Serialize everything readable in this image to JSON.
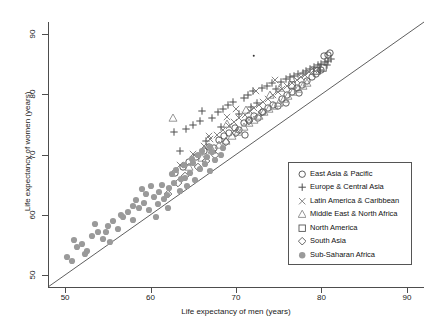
{
  "chart_data": {
    "type": "scatter",
    "title": "",
    "xlabel": "Life expectancy of men (years)",
    "ylabel": "Life expectancy of women (years)",
    "xlim": [
      48,
      92
    ],
    "ylim": [
      48,
      92
    ],
    "xticks": [
      50,
      60,
      70,
      80,
      90
    ],
    "yticks": [
      50,
      60,
      70,
      80,
      90
    ],
    "grid": false,
    "legend_position": "bottom-right",
    "annotations": [
      {
        "type": "reference-line",
        "label": "y = x identity line",
        "from": [
          48,
          48
        ],
        "to": [
          92,
          92
        ]
      }
    ],
    "series": [
      {
        "name": "East Asia & Pacific",
        "marker": "circle-open",
        "color": "#4d4d4d",
        "points": [
          [
            64.5,
            68.8
          ],
          [
            65.3,
            69.6
          ],
          [
            66.2,
            70.5
          ],
          [
            66.8,
            71.2
          ],
          [
            67.4,
            71.0
          ],
          [
            68.0,
            72.4
          ],
          [
            68.6,
            73.1
          ],
          [
            69.2,
            73.6
          ],
          [
            69.9,
            74.4
          ],
          [
            70.4,
            74.0
          ],
          [
            70.9,
            75.2
          ],
          [
            71.5,
            75.8
          ],
          [
            72.1,
            76.4
          ],
          [
            72.6,
            76.0
          ],
          [
            73.2,
            77.1
          ],
          [
            73.8,
            77.8
          ],
          [
            74.3,
            78.3
          ],
          [
            74.9,
            78.0
          ],
          [
            75.4,
            79.2
          ],
          [
            76.0,
            79.8
          ],
          [
            76.6,
            80.4
          ],
          [
            77.1,
            81.0
          ],
          [
            77.7,
            81.6
          ],
          [
            78.3,
            82.2
          ],
          [
            78.9,
            82.8
          ],
          [
            79.4,
            83.4
          ],
          [
            79.9,
            84.0
          ],
          [
            80.3,
            86.3
          ],
          [
            80.8,
            86.6
          ],
          [
            81.0,
            86.9
          ],
          [
            63.8,
            67.9
          ],
          [
            62.9,
            67.0
          ],
          [
            71.0,
            73.2
          ],
          [
            75.8,
            78.6
          ],
          [
            77.4,
            80.2
          ]
        ]
      },
      {
        "name": "Europe & Central Asia",
        "marker": "plus",
        "color": "#4d4d4d",
        "points": [
          [
            64.2,
            74.3
          ],
          [
            65.0,
            74.9
          ],
          [
            65.8,
            75.5
          ],
          [
            66.5,
            72.3
          ],
          [
            67.2,
            76.1
          ],
          [
            67.9,
            77.0
          ],
          [
            68.5,
            77.6
          ],
          [
            69.1,
            78.2
          ],
          [
            69.7,
            78.8
          ],
          [
            70.3,
            76.8
          ],
          [
            70.9,
            79.4
          ],
          [
            71.4,
            79.9
          ],
          [
            72.0,
            80.5
          ],
          [
            72.5,
            78.6
          ],
          [
            73.1,
            81.0
          ],
          [
            73.6,
            81.4
          ],
          [
            74.2,
            81.8
          ],
          [
            74.7,
            80.9
          ],
          [
            75.3,
            82.1
          ],
          [
            75.8,
            82.5
          ],
          [
            76.3,
            82.8
          ],
          [
            76.8,
            83.0
          ],
          [
            77.3,
            83.3
          ],
          [
            77.8,
            83.6
          ],
          [
            78.2,
            83.9
          ],
          [
            78.7,
            84.2
          ],
          [
            79.1,
            84.5
          ],
          [
            79.6,
            84.8
          ],
          [
            80.0,
            85.1
          ],
          [
            80.4,
            85.4
          ],
          [
            80.8,
            85.6
          ],
          [
            81.1,
            85.9
          ],
          [
            66.0,
            77.3
          ],
          [
            68.2,
            74.6
          ],
          [
            62.8,
            73.8
          ],
          [
            63.5,
            70.5
          ],
          [
            71.8,
            77.9
          ],
          [
            79.8,
            84.0
          ],
          [
            80.6,
            84.9
          ]
        ]
      },
      {
        "name": "Latin America & Caribbean",
        "marker": "x",
        "color": "#777777",
        "points": [
          [
            63.5,
            68.2
          ],
          [
            65.0,
            70.1
          ],
          [
            66.2,
            71.4
          ],
          [
            67.0,
            72.5
          ],
          [
            67.8,
            73.2
          ],
          [
            68.5,
            74.0
          ],
          [
            69.2,
            74.8
          ],
          [
            69.8,
            75.4
          ],
          [
            70.4,
            76.0
          ],
          [
            71.0,
            76.6
          ],
          [
            71.6,
            77.2
          ],
          [
            72.1,
            77.7
          ],
          [
            72.7,
            78.2
          ],
          [
            73.2,
            78.7
          ],
          [
            73.8,
            79.2
          ],
          [
            74.3,
            79.8
          ],
          [
            74.9,
            80.3
          ],
          [
            75.4,
            80.8
          ],
          [
            76.0,
            81.3
          ],
          [
            76.5,
            81.8
          ],
          [
            77.1,
            82.3
          ],
          [
            77.6,
            82.8
          ],
          [
            78.1,
            83.2
          ],
          [
            78.6,
            83.7
          ],
          [
            79.1,
            84.1
          ],
          [
            72.3,
            80.6
          ],
          [
            74.6,
            82.4
          ],
          [
            70.0,
            77.5
          ],
          [
            68.9,
            76.2
          ],
          [
            66.8,
            73.0
          ]
        ]
      },
      {
        "name": "Middle East & North Africa",
        "marker": "triangle-open",
        "color": "#8a8a8a",
        "points": [
          [
            62.6,
            76.0
          ],
          [
            64.5,
            68.0
          ],
          [
            66.0,
            69.5
          ],
          [
            67.2,
            70.8
          ],
          [
            68.0,
            71.5
          ],
          [
            68.8,
            72.3
          ],
          [
            69.5,
            73.0
          ],
          [
            70.2,
            73.8
          ],
          [
            70.9,
            74.5
          ],
          [
            71.5,
            75.2
          ],
          [
            72.1,
            75.8
          ],
          [
            72.7,
            76.4
          ],
          [
            73.3,
            77.0
          ],
          [
            73.9,
            77.5
          ],
          [
            74.5,
            78.1
          ],
          [
            75.0,
            78.6
          ],
          [
            75.6,
            79.2
          ],
          [
            76.1,
            79.7
          ],
          [
            76.7,
            80.3
          ],
          [
            77.2,
            80.8
          ],
          [
            77.8,
            81.4
          ],
          [
            78.3,
            81.9
          ],
          [
            74.0,
            79.9
          ],
          [
            75.2,
            81.1
          ],
          [
            71.2,
            77.4
          ],
          [
            69.0,
            75.0
          ]
        ]
      },
      {
        "name": "North America",
        "marker": "square-open",
        "color": "#555555",
        "points": [
          [
            76.5,
            81.5
          ],
          [
            79.5,
            83.8
          ],
          [
            80.2,
            84.4
          ]
        ]
      },
      {
        "name": "South Asia",
        "marker": "diamond-open",
        "color": "#555555",
        "points": [
          [
            62.0,
            63.5
          ],
          [
            64.0,
            66.5
          ],
          [
            65.5,
            68.0
          ],
          [
            66.5,
            69.0
          ],
          [
            67.5,
            70.0
          ],
          [
            68.8,
            72.0
          ],
          [
            70.0,
            73.5
          ],
          [
            71.5,
            75.5
          ],
          [
            73.0,
            77.0
          ],
          [
            63.2,
            65.2
          ]
        ]
      },
      {
        "name": "Sub-Saharan Africa",
        "marker": "circle-filled",
        "color": "#9a9a9a",
        "points": [
          [
            50.2,
            53.0
          ],
          [
            50.8,
            52.4
          ],
          [
            51.4,
            54.6
          ],
          [
            52.0,
            55.2
          ],
          [
            52.6,
            54.0
          ],
          [
            53.2,
            56.4
          ],
          [
            53.8,
            57.2
          ],
          [
            54.4,
            56.0
          ],
          [
            55.0,
            58.1
          ],
          [
            55.6,
            58.9
          ],
          [
            56.2,
            57.6
          ],
          [
            56.8,
            59.7
          ],
          [
            57.4,
            60.4
          ],
          [
            58.0,
            59.1
          ],
          [
            58.6,
            61.2
          ],
          [
            59.2,
            62.0
          ],
          [
            59.8,
            60.8
          ],
          [
            60.4,
            63.0
          ],
          [
            61.0,
            63.8
          ],
          [
            61.6,
            62.6
          ],
          [
            62.2,
            64.5
          ],
          [
            62.8,
            65.3
          ],
          [
            63.4,
            64.0
          ],
          [
            64.0,
            66.1
          ],
          [
            64.6,
            66.9
          ],
          [
            65.2,
            65.7
          ],
          [
            65.8,
            67.6
          ],
          [
            66.4,
            68.4
          ],
          [
            67.0,
            67.2
          ],
          [
            67.6,
            69.1
          ],
          [
            68.2,
            69.9
          ],
          [
            58.3,
            62.4
          ],
          [
            59.5,
            63.5
          ],
          [
            60.9,
            61.7
          ],
          [
            61.3,
            65.0
          ],
          [
            62.5,
            66.8
          ],
          [
            63.0,
            67.4
          ],
          [
            63.9,
            68.2
          ],
          [
            64.9,
            69.3
          ],
          [
            65.5,
            70.0
          ],
          [
            66.0,
            70.6
          ],
          [
            66.9,
            71.2
          ],
          [
            53.5,
            58.4
          ],
          [
            54.8,
            57.1
          ],
          [
            56.5,
            60.0
          ],
          [
            57.9,
            61.4
          ],
          [
            51.0,
            55.8
          ],
          [
            52.3,
            53.4
          ],
          [
            55.2,
            55.4
          ],
          [
            59.0,
            64.2
          ],
          [
            60.0,
            64.8
          ],
          [
            61.9,
            63.2
          ],
          [
            64.3,
            64.8
          ],
          [
            67.2,
            70.4
          ],
          [
            68.5,
            71.0
          ],
          [
            66.6,
            69.6
          ],
          [
            65.0,
            68.6
          ],
          [
            63.6,
            66.0
          ],
          [
            62.0,
            61.2
          ],
          [
            60.6,
            59.6
          ]
        ]
      }
    ],
    "outlier_point": {
      "x": 72.1,
      "y": 86.4,
      "note": "isolated small dark dot"
    }
  },
  "legend": {
    "entries": [
      {
        "label": "East Asia & Pacific",
        "marker": "circle-open"
      },
      {
        "label": "Europe & Central Asia",
        "marker": "plus"
      },
      {
        "label": "Latin America & Caribbean",
        "marker": "x"
      },
      {
        "label": "Middle East & North Africa",
        "marker": "triangle-open"
      },
      {
        "label": "North America",
        "marker": "square-open"
      },
      {
        "label": "South Asia",
        "marker": "diamond-open"
      },
      {
        "label": "Sub-Saharan Africa",
        "marker": "circle-filled"
      }
    ]
  },
  "axes": {
    "x_title": "Life expectancy of men (years)",
    "y_title": "Life expectancy of women (years)",
    "x_tick_labels": [
      "50",
      "60",
      "70",
      "80",
      "90"
    ],
    "y_tick_labels": [
      "50",
      "60",
      "70",
      "80",
      "90"
    ]
  }
}
